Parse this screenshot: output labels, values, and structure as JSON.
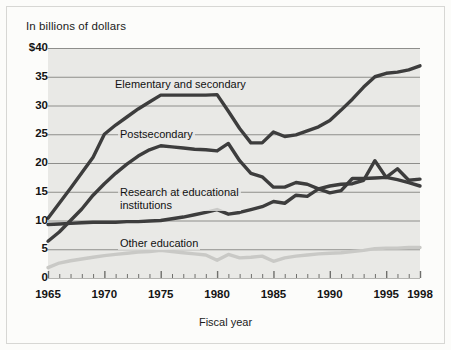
{
  "figure": {
    "background_color": "#fcfcfa",
    "plot_background_color": "#e9e9e6",
    "border_color": "#cccccc"
  },
  "chart_data": {
    "type": "line",
    "title": "",
    "ylabel": "In billions of dollars",
    "xlabel": "Fiscal year",
    "ylim": [
      0,
      40
    ],
    "xlim": [
      1965,
      1998
    ],
    "grid": "horizontal",
    "legend_position": "inline-annotations",
    "ytick_labels": [
      "$40",
      "35",
      "30",
      "25",
      "20",
      "15",
      "10",
      "5",
      "0"
    ],
    "ytick_values": [
      40,
      35,
      30,
      25,
      20,
      15,
      10,
      5,
      0
    ],
    "xtick_labels": [
      "1965",
      "1970",
      "1975",
      "1980",
      "1985",
      "1990",
      "1995",
      "1998"
    ],
    "xtick_values": [
      1965,
      1970,
      1975,
      1980,
      1985,
      1990,
      1995,
      1998
    ],
    "x": [
      1965,
      1966,
      1967,
      1968,
      1969,
      1970,
      1971,
      1972,
      1973,
      1974,
      1975,
      1976,
      1977,
      1978,
      1979,
      1980,
      1981,
      1982,
      1983,
      1984,
      1985,
      1986,
      1987,
      1988,
      1989,
      1990,
      1991,
      1992,
      1993,
      1994,
      1995,
      1996,
      1997,
      1998
    ],
    "series": [
      {
        "name": "Elementary and secondary",
        "color": "#3d3d3d",
        "values": [
          10.4,
          13.0,
          15.6,
          18.3,
          21.0,
          25.0,
          26.6,
          28.0,
          29.4,
          30.6,
          31.8,
          31.8,
          31.8,
          31.8,
          31.8,
          31.9,
          29.0,
          26.0,
          23.5,
          23.5,
          25.4,
          24.6,
          24.9,
          25.6,
          26.3,
          27.4,
          29.2,
          31.1,
          33.2,
          35.0,
          35.6,
          35.8,
          36.2,
          36.9
        ]
      },
      {
        "name": "Postsecondary",
        "color": "#3d3d3d",
        "values": [
          6.4,
          8.0,
          10.0,
          12.0,
          14.4,
          16.4,
          18.2,
          19.8,
          21.2,
          22.3,
          23.0,
          22.8,
          22.6,
          22.4,
          22.3,
          22.1,
          23.4,
          20.4,
          18.2,
          17.6,
          15.8,
          15.8,
          16.6,
          16.3,
          15.5,
          14.8,
          15.2,
          17.3,
          17.3,
          17.4,
          17.5,
          17.1,
          16.6,
          16.0
        ]
      },
      {
        "name": "Research at educational institutions",
        "color": "#3d3d3d",
        "values": [
          9.3,
          9.4,
          9.5,
          9.6,
          9.7,
          9.7,
          9.7,
          9.8,
          9.8,
          9.9,
          10.0,
          10.3,
          10.6,
          11.0,
          11.4,
          11.9,
          11.1,
          11.4,
          11.9,
          12.4,
          13.3,
          13.0,
          14.4,
          14.2,
          15.5,
          16.0,
          16.3,
          16.4,
          17.0,
          20.4,
          17.5,
          19.0,
          17.0,
          17.2
        ]
      },
      {
        "name": "Other education",
        "color": "#c9c9c6",
        "values": [
          1.8,
          2.6,
          3.0,
          3.3,
          3.6,
          3.9,
          4.1,
          4.3,
          4.5,
          4.6,
          4.8,
          4.6,
          4.4,
          4.2,
          4.0,
          3.1,
          4.1,
          3.5,
          3.6,
          3.8,
          2.9,
          3.5,
          3.8,
          4.0,
          4.2,
          4.3,
          4.4,
          4.6,
          4.8,
          5.1,
          5.2,
          5.2,
          5.3,
          5.3
        ]
      }
    ],
    "annotations": [
      {
        "text": "Elementary and secondary",
        "series": "Elementary and secondary"
      },
      {
        "text": "Postsecondary",
        "series": "Postsecondary"
      },
      {
        "text": "Research at educational\ninstitutions",
        "line1": "Research at educational",
        "line2": "institutions",
        "series": "Research at educational institutions"
      },
      {
        "text": "Other education",
        "series": "Other education"
      }
    ]
  }
}
